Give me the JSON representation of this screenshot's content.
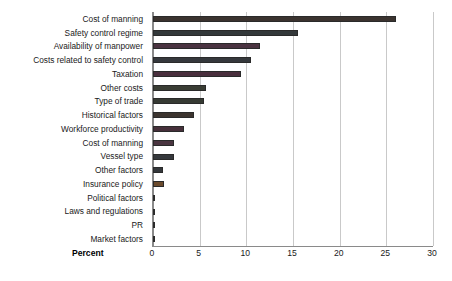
{
  "chart_data": {
    "type": "bar",
    "orientation": "horizontal",
    "title": "",
    "xlabel": "Percent",
    "ylabel": "",
    "xlim": [
      0,
      30
    ],
    "xticks": [
      0,
      5,
      10,
      15,
      20,
      25,
      30
    ],
    "grid": true,
    "legend": "none",
    "categories": [
      "Cost of manning",
      "Safety control regime",
      "Availability of manpower",
      "Costs related to safety control",
      "Taxation",
      "Other costs",
      "Type of trade",
      "Historical factors",
      "Workforce productivity",
      "Cost of manning",
      "Vessel type",
      "Other factors",
      "Insurance policy",
      "Political factors",
      "Laws and regulations",
      "PR",
      "Market factors"
    ],
    "values": [
      26.0,
      15.5,
      11.5,
      10.5,
      9.4,
      5.7,
      5.5,
      4.4,
      3.3,
      2.2,
      2.2,
      1.1,
      1.2,
      0.0,
      0.0,
      0.0,
      0.0
    ],
    "bar_colors": [
      "#3b332f",
      "#33383a",
      "#4a3340",
      "#35383c",
      "#4a2f3d",
      "#3a3d34",
      "#363a33",
      "#3c342f",
      "#46303a",
      "#4a3540",
      "#35383c",
      "#34373a",
      "#6b4a2c",
      "#555555",
      "#555555",
      "#555555",
      "#555555"
    ],
    "axis_color": "#8a8a8a",
    "gridline_color": "#c9c9c9",
    "background": "#ffffff"
  }
}
